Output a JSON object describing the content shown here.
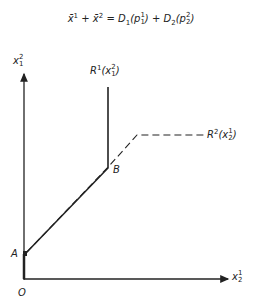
{
  "equation": {
    "lhs_term1": "x̄",
    "lhs_term1_sup": "1",
    "plus1": " + ",
    "lhs_term2": "x̄",
    "lhs_term2_sup": "2",
    "equals": " = ",
    "rhs_term1_func": "D",
    "rhs_term1_sub": "1",
    "rhs_term1_arg": "p",
    "rhs_term1_arg_sup": "1",
    "rhs_term1_arg_sub": "1",
    "plus2": " + ",
    "rhs_term2_func": "D",
    "rhs_term2_sub": "2",
    "rhs_term2_arg": "p",
    "rhs_term2_arg_sup": "2",
    "rhs_term2_arg_sub": "2"
  },
  "axes": {
    "y_label": "x",
    "y_label_sup": "2",
    "y_label_sub": "1",
    "x_label": "x",
    "x_label_sup": "1",
    "x_label_sub": "2",
    "origin_label": "O"
  },
  "points": {
    "a_label": "A",
    "b_label": "B"
  },
  "curves": {
    "r1_label": "R",
    "r1_sup": "1",
    "r1_arg": "x",
    "r1_arg_sup": "2",
    "r1_arg_sub": "1",
    "r1_style": "solid",
    "r2_label": "R",
    "r2_sup": "2",
    "r2_arg": "x",
    "r2_arg_sup": "1",
    "r2_arg_sub": "2",
    "r2_style": "dashed"
  },
  "colors": {
    "ink": "#222222",
    "background": "#ffffff"
  }
}
